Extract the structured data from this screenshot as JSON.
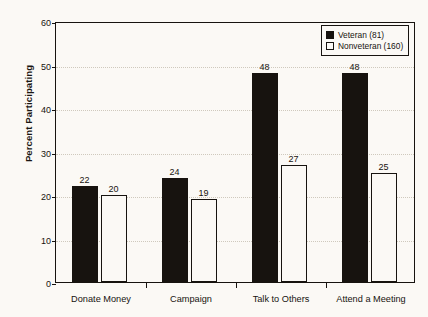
{
  "chart_data": {
    "type": "bar",
    "title": "",
    "subtitle": "",
    "xlabel": "",
    "ylabel": "Percent Participating",
    "ylim": [
      0,
      60
    ],
    "yticks": [
      0,
      10,
      20,
      30,
      40,
      50,
      60
    ],
    "ytick_labels": [
      "0",
      "10",
      "20",
      "30",
      "40",
      "50",
      "60"
    ],
    "grid": true,
    "grid_axis": "y",
    "grid_style": "dotted",
    "legend_position": "top-right",
    "categories": [
      "Donate Money",
      "Campaign",
      "Talk to Others",
      "Attend a Meeting"
    ],
    "series": [
      {
        "name": "Veteran (81)",
        "color": "#17130f",
        "fill": "solid",
        "values": [
          22,
          24,
          48,
          48
        ],
        "value_labels": [
          "22",
          "24",
          "48",
          "48"
        ]
      },
      {
        "name": "Nonveteran (160)",
        "color": "#fbf9f5",
        "edge_color": "#17130f",
        "fill": "hollow",
        "values": [
          20,
          19,
          27,
          25
        ],
        "value_labels": [
          "20",
          "19",
          "27",
          "25"
        ]
      }
    ]
  },
  "legend": {
    "items": [
      {
        "label": "Veteran (81)",
        "swatch": "filled-square-icon"
      },
      {
        "label": "Nonveteran (160)",
        "swatch": "hollow-square-icon"
      }
    ]
  },
  "colors": {
    "background": "#fbf9f5",
    "axis": "#17130f",
    "grid": "#cfc9bd",
    "series_veteran": "#17130f",
    "series_nonveteran": "#fbf9f5"
  }
}
